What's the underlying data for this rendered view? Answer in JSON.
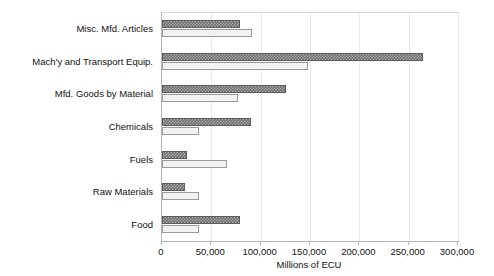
{
  "chart_data": {
    "type": "bar",
    "orientation": "horizontal",
    "title": "",
    "xlabel": "Millions of ECU",
    "ylabel": "",
    "xlim": [
      0,
      300000
    ],
    "xticks": [
      0,
      50000,
      100000,
      150000,
      200000,
      250000,
      300000
    ],
    "xticklabels": [
      "0",
      "50,000",
      "100,000",
      "150,000",
      "200,000",
      "250,000",
      "300,000"
    ],
    "grid": true,
    "legend": "none",
    "categories": [
      "Misc. Mfd. Articles",
      "Mach'y and Transport Equip.",
      "Mfd. Goods by Material",
      "Chemicals",
      "Fuels",
      "Raw Materials",
      "Food"
    ],
    "series": [
      {
        "name": "Series A",
        "color": "#6e6e6e",
        "pattern": "checkered",
        "values": [
          79000,
          265000,
          126000,
          90000,
          25000,
          23000,
          79000
        ]
      },
      {
        "name": "Series B",
        "color": "#f2f2f2",
        "pattern": "solid",
        "values": [
          91000,
          148000,
          77000,
          37000,
          66000,
          37000,
          38000
        ]
      }
    ]
  }
}
